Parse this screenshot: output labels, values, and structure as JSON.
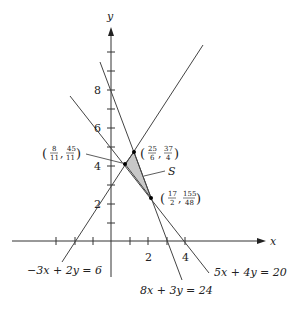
{
  "axes": {
    "x_label": "x",
    "y_label": "y",
    "x_tick_labels": [
      {
        "value": 2,
        "text": "2"
      },
      {
        "value": 4,
        "text": "4"
      }
    ],
    "y_tick_labels": [
      {
        "value": 2,
        "text": "2"
      },
      {
        "value": 4,
        "text": "4"
      },
      {
        "value": 6,
        "text": "6"
      },
      {
        "value": 8,
        "text": "8"
      }
    ]
  },
  "lines": [
    {
      "equation": "−3x + 2y = 6"
    },
    {
      "equation": "8x + 3y = 24"
    },
    {
      "equation": "5x + 4y = 20"
    }
  ],
  "points": [
    {
      "num_x": "8",
      "den_x": "11",
      "num_y": "45",
      "den_y": "11"
    },
    {
      "num_x": "25",
      "den_x": "6",
      "num_y": "37",
      "den_y": "4"
    },
    {
      "num_x": "17",
      "den_x": "2",
      "num_y": "155",
      "den_y": "48"
    }
  ],
  "region": {
    "label": "S",
    "fill": "#c8c8c8"
  }
}
